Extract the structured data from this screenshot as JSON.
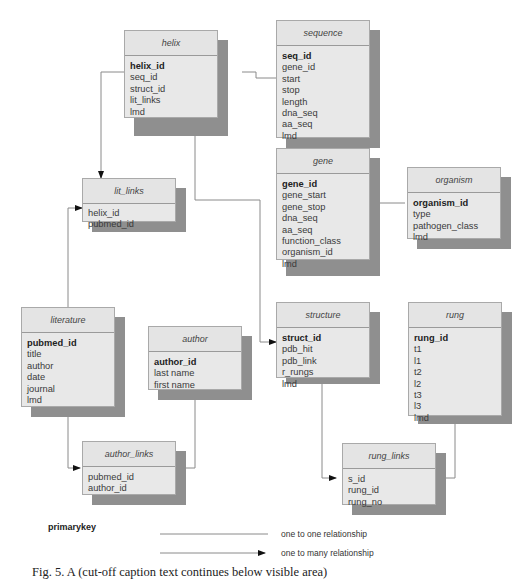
{
  "tables": {
    "helix": {
      "title": "helix",
      "primary_key": "helix_id",
      "fields": [
        "seq_id",
        "struct_id",
        "lit_links",
        "lmd"
      ]
    },
    "sequence": {
      "title": "sequence",
      "primary_key": "seq_id",
      "fields": [
        "gene_id",
        "start",
        "stop",
        "length",
        "dna_seq",
        "aa_seq",
        "lmd"
      ]
    },
    "gene": {
      "title": "gene",
      "primary_key": "gene_id",
      "fields": [
        "gene_start",
        "gene_stop",
        "dna_seq",
        "aa_seq",
        "function_class",
        "organism_id",
        "lmd"
      ]
    },
    "organism": {
      "title": "organism",
      "primary_key": "organism_id",
      "fields": [
        "type",
        "pathogen_class",
        "lmd"
      ]
    },
    "lit_links": {
      "title": "lit_links",
      "primary_key": "",
      "fields": [
        "helix_id",
        "pubmed_id"
      ]
    },
    "literature": {
      "title": "literature",
      "primary_key": "pubmed_id",
      "fields": [
        "title",
        "author",
        "date",
        "journal",
        "lmd"
      ]
    },
    "author": {
      "title": "author",
      "primary_key": "author_id",
      "fields": [
        "last name",
        "first name"
      ]
    },
    "structure": {
      "title": "structure",
      "primary_key": "struct_id",
      "fields": [
        "pdb_hit",
        "pdb_link",
        "r_rungs",
        "lmd"
      ]
    },
    "rung": {
      "title": "rung",
      "primary_key": "rung_id",
      "fields": [
        "t1",
        "l1",
        "t2",
        "l2",
        "t3",
        "l3",
        "lmd"
      ]
    },
    "author_links": {
      "title": "author_links",
      "primary_key": "",
      "fields": [
        "pubmed_id",
        "author_id"
      ]
    },
    "rung_links": {
      "title": "rung_links",
      "primary_key": "",
      "fields": [
        "s_id",
        "rung_id",
        "rung_no"
      ]
    }
  },
  "relationships": [
    {
      "from": "helix",
      "to": "sequence",
      "type": "one to one"
    },
    {
      "from": "sequence",
      "to": "gene",
      "type": "one to one"
    },
    {
      "from": "gene",
      "to": "organism",
      "type": "one to one"
    },
    {
      "from": "helix",
      "to": "lit_links",
      "type": "one to many"
    },
    {
      "from": "literature",
      "to": "lit_links",
      "type": "one to many"
    },
    {
      "from": "helix",
      "to": "structure",
      "type": "one to many"
    },
    {
      "from": "literature",
      "to": "author_links",
      "type": "one to many"
    },
    {
      "from": "author",
      "to": "author_links",
      "type": "one to many"
    },
    {
      "from": "structure",
      "to": "rung_links",
      "type": "one to many"
    },
    {
      "from": "rung",
      "to": "rung_links",
      "type": "one to one"
    }
  ],
  "legend": {
    "primary_key_label": "primarykey",
    "one_to_one_label": "one to one relationship",
    "one_to_many_label": "one to many relationship"
  },
  "caption": "Fig. 5. A (cut-off caption text continues below visible area)"
}
